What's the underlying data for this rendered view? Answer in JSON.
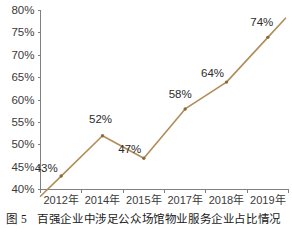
{
  "chart_data": {
    "type": "line",
    "title": "",
    "xlabel": "",
    "ylabel": "",
    "categories": [
      "2012年",
      "2014年",
      "2015年",
      "2017年",
      "2018年",
      "2019年"
    ],
    "values": [
      43,
      52,
      47,
      58,
      64,
      74
    ],
    "data_labels": [
      "43%",
      "52%",
      "47%",
      "58%",
      "64%",
      "74%"
    ],
    "ylim": [
      40,
      80
    ],
    "ytick_labels": [
      "40%",
      "45%",
      "50%",
      "55%",
      "60%",
      "65%",
      "70%",
      "75%",
      "80%"
    ],
    "ytick_values": [
      40,
      45,
      50,
      55,
      60,
      65,
      70,
      75,
      80
    ],
    "grid": false,
    "legend": null,
    "series_color": "#b08d59",
    "marker_color": "#8a6b3c",
    "axis_color": "#808080",
    "text_color": "#3a3a3a"
  },
  "caption": {
    "number": "图 5",
    "text": "百强企业中涉足公众场馆物业服务企业占比情况"
  }
}
